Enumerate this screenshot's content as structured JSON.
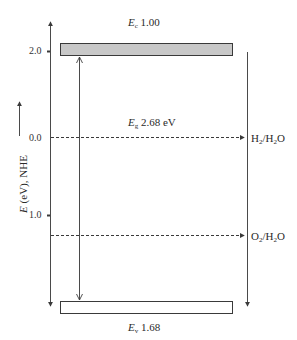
{
  "diagram": {
    "type": "band-energy-diagram",
    "y_axis": {
      "label_symbol": "E",
      "label_rest": " (eV), NHE",
      "ticks": [
        {
          "label": "2.0",
          "y": 51
        },
        {
          "label": "0.0",
          "y": 138
        },
        {
          "label": "1.0",
          "y": 215
        }
      ]
    },
    "conduction_band": {
      "symbol": "E",
      "subscript": "c",
      "value": "1.00",
      "fill": "#c8c8c8"
    },
    "band_gap": {
      "symbol": "E",
      "subscript": "g",
      "value": "2.68 eV"
    },
    "valence_band": {
      "symbol": "E",
      "subscript": "v",
      "value": "1.68",
      "fill": "#ffffff"
    },
    "redox_levels": [
      {
        "label_main": "H",
        "sub1": "2",
        "mid": "/H",
        "sub2": "2",
        "end": "O"
      },
      {
        "label_main": "O",
        "sub1": "2",
        "mid": "/H",
        "sub2": "2",
        "end": "O"
      }
    ],
    "colors": {
      "line": "#4a4a4a",
      "band_border": "#3a3a3a"
    }
  }
}
